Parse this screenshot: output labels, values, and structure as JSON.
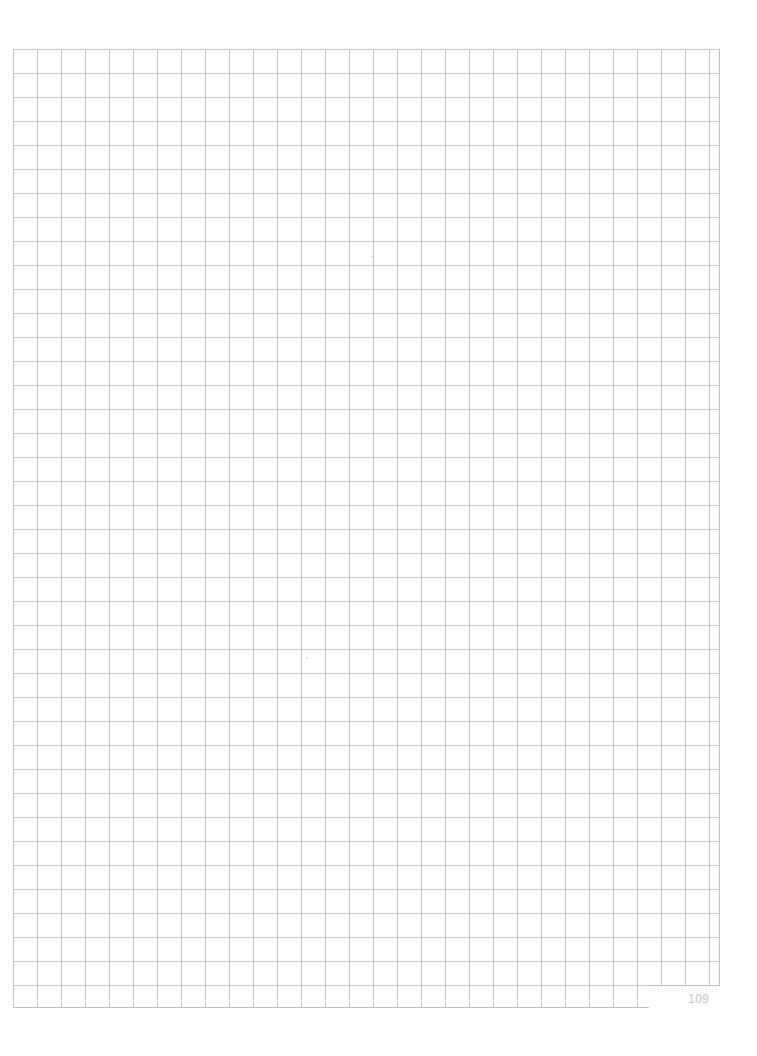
{
  "page": {
    "kind": "graph-paper-scan",
    "width": 757,
    "height": 1056,
    "background_color": "#ffffff",
    "page_number": "109",
    "page_number_color": "#c3c4c8",
    "page_number_position": {
      "x": 688,
      "y": 992
    }
  },
  "grid": {
    "label": "square-ruled grid",
    "origin": {
      "x": 13,
      "y": 49
    },
    "width": 707,
    "height": 959,
    "cell_size": 24,
    "columns": 30,
    "rows": 40,
    "line_color": "#c7c8cc",
    "minor_line_color": "#d9dade",
    "border_color": "#bcbdc2",
    "line_width": 1,
    "ragged_corner": {
      "description": "bottom-right columns end one row early",
      "x": 649,
      "y": 985,
      "width": 71,
      "height": 23
    }
  },
  "marks": [
    {
      "name": "scan-speck-1",
      "x": 371,
      "y": 256,
      "size": 2
    },
    {
      "name": "scan-speck-2",
      "x": 306,
      "y": 657,
      "size": 2
    }
  ]
}
